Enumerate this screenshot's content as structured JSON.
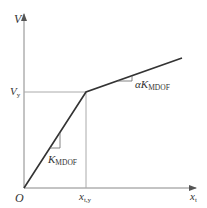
{
  "diagram": {
    "type": "bilinear force-displacement curve",
    "axes": {
      "y_label": "V",
      "x_label_main": "x",
      "x_label_sub": "t",
      "origin_label": "O"
    },
    "yield": {
      "v_label_main": "V",
      "v_label_sub": "y",
      "x_label_main": "x",
      "x_label_sub": "t,y"
    },
    "slopes": {
      "initial_main": "K",
      "initial_sub": "MDOF",
      "post_prefix": "α",
      "post_main": "K",
      "post_sub": "MDOF"
    },
    "colors": {
      "curve": "#333333",
      "axis": "#888888",
      "guide": "#aaaaaa"
    }
  }
}
